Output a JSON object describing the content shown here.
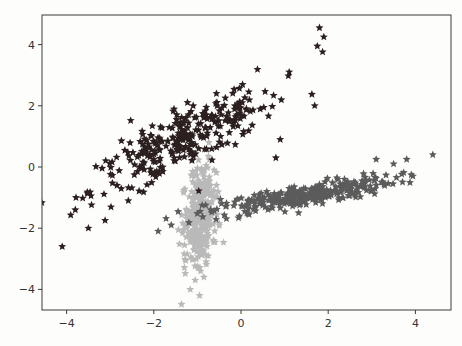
{
  "chart_data": {
    "type": "scatter",
    "title": "",
    "xlabel": "",
    "ylabel": "",
    "xlim": [
      -4.4,
      4.9
    ],
    "ylim": [
      -4.7,
      5.0
    ],
    "grid": false,
    "legend": null,
    "marker": "star",
    "x_ticks": [
      -4,
      -2,
      0,
      2,
      4
    ],
    "x_tick_labels": [
      "−4",
      "−2",
      "0",
      "2",
      "4"
    ],
    "y_ticks": [
      4,
      2,
      0,
      -2,
      -4
    ],
    "y_tick_labels": [
      "4",
      "2",
      "0",
      "−2",
      "−4"
    ],
    "series": [
      {
        "name": "cluster-dark",
        "color": "#2b1f20",
        "n": 300,
        "center": [
          -1.3,
          0.9
        ],
        "spread_along": 1.35,
        "spread_across": 0.38,
        "angle_deg": 38,
        "outliers": [
          [
            -4.1,
            -2.6
          ],
          [
            1.8,
            4.55
          ],
          [
            1.9,
            4.25
          ],
          [
            1.75,
            3.95
          ],
          [
            -3.5,
            -2.0
          ],
          [
            0.9,
            0.9
          ],
          [
            0.8,
            0.3
          ],
          [
            -3.8,
            -1.4
          ]
        ]
      },
      {
        "name": "cluster-medium",
        "color": "#5b5b5b",
        "n": 300,
        "center": [
          1.4,
          -0.95
        ],
        "spread_along": 1.1,
        "spread_across": 0.18,
        "angle_deg": 14,
        "outliers": [
          [
            4.4,
            0.4
          ],
          [
            3.5,
            0.1
          ],
          [
            3.1,
            0.25
          ],
          [
            3.8,
            0.25
          ],
          [
            -1.9,
            -2.1
          ],
          [
            -1.6,
            -1.9
          ]
        ]
      },
      {
        "name": "cluster-light",
        "color": "#b9b9b9",
        "n": 300,
        "center": [
          -0.95,
          -1.55
        ],
        "spread_along": 0.85,
        "spread_across": 0.18,
        "angle_deg": 86,
        "outliers": [
          [
            -0.95,
            -4.2
          ],
          [
            -1.05,
            -3.7
          ],
          [
            -0.85,
            -3.6
          ],
          [
            -0.8,
            -3.1
          ],
          [
            -0.75,
            -2.9
          ]
        ]
      }
    ]
  },
  "plot_area": {
    "left_px": 42,
    "top_px": 15,
    "right_px": 451,
    "bottom_px": 310,
    "x_px_per_unit": 43.6,
    "x_zero_px": 241,
    "y_px_per_unit": 30.6,
    "y_zero_px": 167
  }
}
